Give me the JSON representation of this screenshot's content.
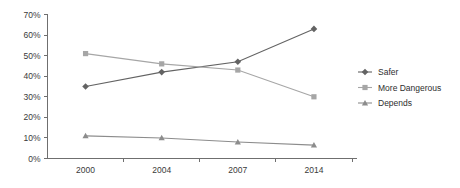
{
  "chart_data": {
    "type": "line",
    "title": "",
    "xlabel": "",
    "ylabel": "",
    "categories": [
      "2000",
      "2004",
      "2007",
      "2014"
    ],
    "ylim": [
      0,
      70
    ],
    "ytick_labels": [
      "0%",
      "10%",
      "20%",
      "30%",
      "40%",
      "50%",
      "60%",
      "70%"
    ],
    "ytick_values": [
      0,
      10,
      20,
      30,
      40,
      50,
      60,
      70
    ],
    "grid": false,
    "legend_position": "right",
    "series": [
      {
        "name": "Safer",
        "values": [
          35,
          42,
          47,
          63
        ],
        "color": "#636363",
        "marker": "diamond"
      },
      {
        "name": "More Dangerous",
        "values": [
          51,
          46,
          43,
          30
        ],
        "color": "#a6a6a6",
        "marker": "square"
      },
      {
        "name": "Depends",
        "values": [
          11,
          10,
          8,
          6.5
        ],
        "color": "#8c8c8c",
        "marker": "triangle"
      }
    ]
  },
  "legend": {
    "items": [
      {
        "label": "Safer"
      },
      {
        "label": "More Dangerous"
      },
      {
        "label": "Depends"
      }
    ]
  }
}
